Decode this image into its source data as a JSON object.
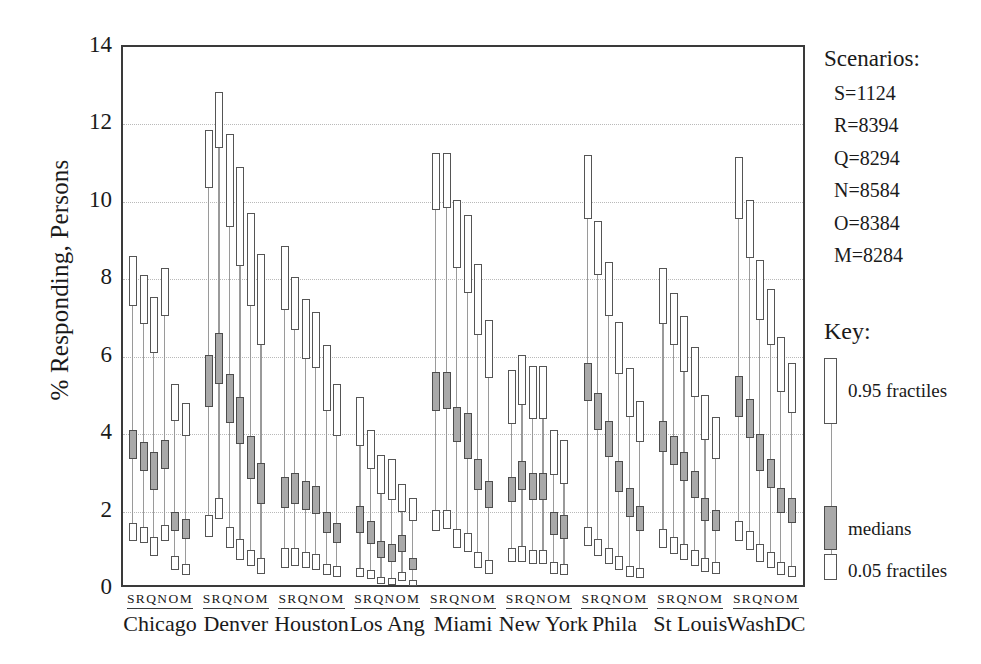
{
  "chart_data": {
    "type": "box",
    "title": "",
    "xlabel": "",
    "ylabel": "% Responding, Persons",
    "ylim": [
      0,
      14
    ],
    "yticks": [
      0,
      2,
      4,
      6,
      8,
      10,
      12,
      14
    ],
    "grid": "horizontal-dotted",
    "legend_position": "right",
    "categories": [
      "Chicago",
      "Denver",
      "Houston",
      "Los Ang",
      "Miami",
      "New York",
      "Phila",
      "St Louis",
      "WashDC"
    ],
    "scenario_codes": [
      "S",
      "R",
      "Q",
      "N",
      "O",
      "M"
    ],
    "value_keys": [
      "p05_low",
      "p05_high",
      "median_low",
      "median_high",
      "p95_low",
      "p95_high"
    ],
    "groups": [
      {
        "city": "Chicago",
        "series": [
          {
            "code": "S",
            "p05": [
              1.25,
              1.7
            ],
            "median": [
              3.35,
              4.1
            ],
            "p95": [
              7.3,
              8.6
            ]
          },
          {
            "code": "R",
            "p05": [
              1.2,
              1.6
            ],
            "median": [
              3.05,
              3.8
            ],
            "p95": [
              6.85,
              8.1
            ]
          },
          {
            "code": "Q",
            "p05": [
              0.85,
              1.35
            ],
            "median": [
              2.55,
              3.55
            ],
            "p95": [
              6.1,
              7.55
            ]
          },
          {
            "code": "N",
            "p05": [
              1.25,
              1.65
            ],
            "median": [
              3.1,
              3.85
            ],
            "p95": [
              7.05,
              8.3
            ]
          },
          {
            "code": "O",
            "p05": [
              0.5,
              0.85
            ],
            "median": [
              1.5,
              2.0
            ],
            "p95": [
              4.35,
              5.3
            ]
          },
          {
            "code": "M",
            "p05": [
              0.35,
              0.65
            ],
            "median": [
              1.3,
              1.8
            ],
            "p95": [
              3.95,
              4.8
            ]
          }
        ]
      },
      {
        "city": "Denver",
        "series": [
          {
            "code": "S",
            "p05": [
              1.35,
              1.9
            ],
            "median": [
              4.7,
              6.05
            ],
            "p95": [
              10.35,
              11.85
            ]
          },
          {
            "code": "R",
            "p05": [
              1.8,
              2.35
            ],
            "median": [
              5.3,
              6.6
            ],
            "p95": [
              11.4,
              12.85
            ]
          },
          {
            "code": "Q",
            "p05": [
              1.05,
              1.6
            ],
            "median": [
              4.3,
              5.55
            ],
            "p95": [
              9.35,
              11.75
            ]
          },
          {
            "code": "N",
            "p05": [
              0.75,
              1.3
            ],
            "median": [
              3.75,
              4.95
            ],
            "p95": [
              8.35,
              10.9
            ]
          },
          {
            "code": "O",
            "p05": [
              0.6,
              1.0
            ],
            "median": [
              2.85,
              3.95
            ],
            "p95": [
              7.3,
              9.7
            ]
          },
          {
            "code": "M",
            "p05": [
              0.4,
              0.8
            ],
            "median": [
              2.2,
              3.25
            ],
            "p95": [
              6.3,
              8.65
            ]
          }
        ]
      },
      {
        "city": "Houston",
        "series": [
          {
            "code": "S",
            "p05": [
              0.55,
              1.05
            ],
            "median": [
              2.1,
              2.9
            ],
            "p95": [
              7.2,
              8.85
            ]
          },
          {
            "code": "R",
            "p05": [
              0.6,
              1.05
            ],
            "median": [
              2.2,
              3.0
            ],
            "p95": [
              6.7,
              8.05
            ]
          },
          {
            "code": "Q",
            "p05": [
              0.55,
              0.95
            ],
            "median": [
              2.05,
              2.8
            ],
            "p95": [
              5.95,
              7.5
            ]
          },
          {
            "code": "N",
            "p05": [
              0.5,
              0.9
            ],
            "median": [
              1.95,
              2.65
            ],
            "p95": [
              5.7,
              7.15
            ]
          },
          {
            "code": "O",
            "p05": [
              0.35,
              0.65
            ],
            "median": [
              1.45,
              2.0
            ],
            "p95": [
              4.6,
              6.3
            ]
          },
          {
            "code": "M",
            "p05": [
              0.3,
              0.6
            ],
            "median": [
              1.2,
              1.7
            ],
            "p95": [
              3.95,
              5.3
            ]
          }
        ]
      },
      {
        "city": "Los Ang",
        "series": [
          {
            "code": "S",
            "p05": [
              0.3,
              0.55
            ],
            "median": [
              1.45,
              2.15
            ],
            "p95": [
              3.7,
              4.95
            ]
          },
          {
            "code": "R",
            "p05": [
              0.25,
              0.5
            ],
            "median": [
              1.15,
              1.75
            ],
            "p95": [
              3.1,
              4.1
            ]
          },
          {
            "code": "Q",
            "p05": [
              0.12,
              0.32
            ],
            "median": [
              0.8,
              1.25
            ],
            "p95": [
              2.45,
              3.45
            ]
          },
          {
            "code": "N",
            "p05": [
              0.1,
              0.28
            ],
            "median": [
              0.7,
              1.15
            ],
            "p95": [
              2.3,
              3.35
            ]
          },
          {
            "code": "O",
            "p05": [
              0.2,
              0.45
            ],
            "median": [
              0.95,
              1.4
            ],
            "p95": [
              2.0,
              2.7
            ]
          },
          {
            "code": "M",
            "p05": [
              0.08,
              0.22
            ],
            "median": [
              0.5,
              0.8
            ],
            "p95": [
              1.75,
              2.35
            ]
          }
        ]
      },
      {
        "city": "Miami",
        "series": [
          {
            "code": "S",
            "p05": [
              1.5,
              2.05
            ],
            "median": [
              4.6,
              5.6
            ],
            "p95": [
              9.8,
              11.25
            ]
          },
          {
            "code": "R",
            "p05": [
              1.55,
              2.05
            ],
            "median": [
              4.65,
              5.6
            ],
            "p95": [
              9.85,
              11.25
            ]
          },
          {
            "code": "Q",
            "p05": [
              1.05,
              1.55
            ],
            "median": [
              3.8,
              4.7
            ],
            "p95": [
              8.3,
              10.05
            ]
          },
          {
            "code": "N",
            "p05": [
              0.95,
              1.45
            ],
            "median": [
              3.35,
              4.55
            ],
            "p95": [
              7.65,
              9.65
            ]
          },
          {
            "code": "O",
            "p05": [
              0.55,
              0.95
            ],
            "median": [
              2.55,
              3.35
            ],
            "p95": [
              6.55,
              8.4
            ]
          },
          {
            "code": "M",
            "p05": [
              0.4,
              0.75
            ],
            "median": [
              2.1,
              2.8
            ],
            "p95": [
              5.45,
              6.95
            ]
          }
        ]
      },
      {
        "city": "New York",
        "series": [
          {
            "code": "S",
            "p05": [
              0.7,
              1.05
            ],
            "median": [
              2.25,
              2.9
            ],
            "p95": [
              4.25,
              5.65
            ]
          },
          {
            "code": "R",
            "p05": [
              0.7,
              1.1
            ],
            "median": [
              2.55,
              3.3
            ],
            "p95": [
              4.75,
              6.05
            ]
          },
          {
            "code": "Q",
            "p05": [
              0.65,
              1.0
            ],
            "median": [
              2.3,
              3.0
            ],
            "p95": [
              4.4,
              5.75
            ]
          },
          {
            "code": "N",
            "p05": [
              0.65,
              1.0
            ],
            "median": [
              2.3,
              3.0
            ],
            "p95": [
              4.4,
              5.75
            ]
          },
          {
            "code": "O",
            "p05": [
              0.4,
              0.7
            ],
            "median": [
              1.4,
              2.0
            ],
            "p95": [
              2.95,
              4.1
            ]
          },
          {
            "code": "M",
            "p05": [
              0.35,
              0.65
            ],
            "median": [
              1.3,
              1.9
            ],
            "p95": [
              2.7,
              3.85
            ]
          }
        ]
      },
      {
        "city": "Phila",
        "series": [
          {
            "code": "S",
            "p05": [
              1.1,
              1.6
            ],
            "median": [
              4.85,
              5.85
            ],
            "p95": [
              9.55,
              11.2
            ]
          },
          {
            "code": "R",
            "p05": [
              0.85,
              1.3
            ],
            "median": [
              4.1,
              5.05
            ],
            "p95": [
              8.1,
              9.5
            ]
          },
          {
            "code": "Q",
            "p05": [
              0.65,
              1.05
            ],
            "median": [
              3.4,
              4.35
            ],
            "p95": [
              7.05,
              8.45
            ]
          },
          {
            "code": "N",
            "p05": [
              0.5,
              0.85
            ],
            "median": [
              2.5,
              3.3
            ],
            "p95": [
              5.55,
              6.9
            ]
          },
          {
            "code": "O",
            "p05": [
              0.3,
              0.6
            ],
            "median": [
              1.85,
              2.6
            ],
            "p95": [
              4.45,
              5.7
            ]
          },
          {
            "code": "M",
            "p05": [
              0.28,
              0.55
            ],
            "median": [
              1.5,
              2.15
            ],
            "p95": [
              3.8,
              4.85
            ]
          }
        ]
      },
      {
        "city": "St Louis",
        "series": [
          {
            "code": "S",
            "p05": [
              1.05,
              1.55
            ],
            "median": [
              3.55,
              4.35
            ],
            "p95": [
              6.85,
              8.3
            ]
          },
          {
            "code": "R",
            "p05": [
              0.9,
              1.35
            ],
            "median": [
              3.2,
              3.95
            ],
            "p95": [
              6.3,
              7.65
            ]
          },
          {
            "code": "Q",
            "p05": [
              0.75,
              1.15
            ],
            "median": [
              2.8,
              3.55
            ],
            "p95": [
              5.6,
              7.05
            ]
          },
          {
            "code": "N",
            "p05": [
              0.6,
              1.0
            ],
            "median": [
              2.35,
              3.05
            ],
            "p95": [
              4.95,
              6.25
            ]
          },
          {
            "code": "O",
            "p05": [
              0.45,
              0.8
            ],
            "median": [
              1.75,
              2.35
            ],
            "p95": [
              3.85,
              5.0
            ]
          },
          {
            "code": "M",
            "p05": [
              0.4,
              0.7
            ],
            "median": [
              1.5,
              2.05
            ],
            "p95": [
              3.35,
              4.45
            ]
          }
        ]
      },
      {
        "city": "WashDC",
        "series": [
          {
            "code": "S",
            "p05": [
              1.25,
              1.75
            ],
            "median": [
              4.45,
              5.5
            ],
            "p95": [
              9.55,
              11.15
            ]
          },
          {
            "code": "R",
            "p05": [
              1.0,
              1.5
            ],
            "median": [
              3.9,
              4.9
            ],
            "p95": [
              8.55,
              10.05
            ]
          },
          {
            "code": "Q",
            "p05": [
              0.7,
              1.15
            ],
            "median": [
              3.05,
              4.0
            ],
            "p95": [
              6.95,
              8.5
            ]
          },
          {
            "code": "N",
            "p05": [
              0.55,
              0.95
            ],
            "median": [
              2.6,
              3.35
            ],
            "p95": [
              6.3,
              7.75
            ]
          },
          {
            "code": "O",
            "p05": [
              0.35,
              0.7
            ],
            "median": [
              1.95,
              2.6
            ],
            "p95": [
              5.1,
              6.5
            ]
          },
          {
            "code": "M",
            "p05": [
              0.3,
              0.6
            ],
            "median": [
              1.7,
              2.35
            ],
            "p95": [
              4.55,
              5.85
            ]
          }
        ]
      }
    ]
  },
  "axis": {
    "y_label": "% Responding, Persons",
    "y_ticks": [
      "0",
      "2",
      "4",
      "6",
      "8",
      "10",
      "12",
      "14"
    ],
    "x_codes": "S R Q N O M"
  },
  "legend": {
    "title": "Scenarios:",
    "items": [
      {
        "label": "S=1124"
      },
      {
        "label": "R=8394"
      },
      {
        "label": "Q=8294"
      },
      {
        "label": "N=8584"
      },
      {
        "label": "O=8384"
      },
      {
        "label": "M=8284"
      }
    ]
  },
  "key": {
    "title": "Key:",
    "top_label": "0.95 fractiles",
    "middle_label": "medians",
    "bottom_label": "0.05 fractiles"
  },
  "colors": {
    "frame": "#3a3a3a",
    "grid": "#b9b9b9",
    "box_stroke": "#555555",
    "box_fill": "#ffffff",
    "median_fill": "#a9a9a9",
    "stem": "#9a9a9a",
    "text": "#1a1a1a"
  }
}
